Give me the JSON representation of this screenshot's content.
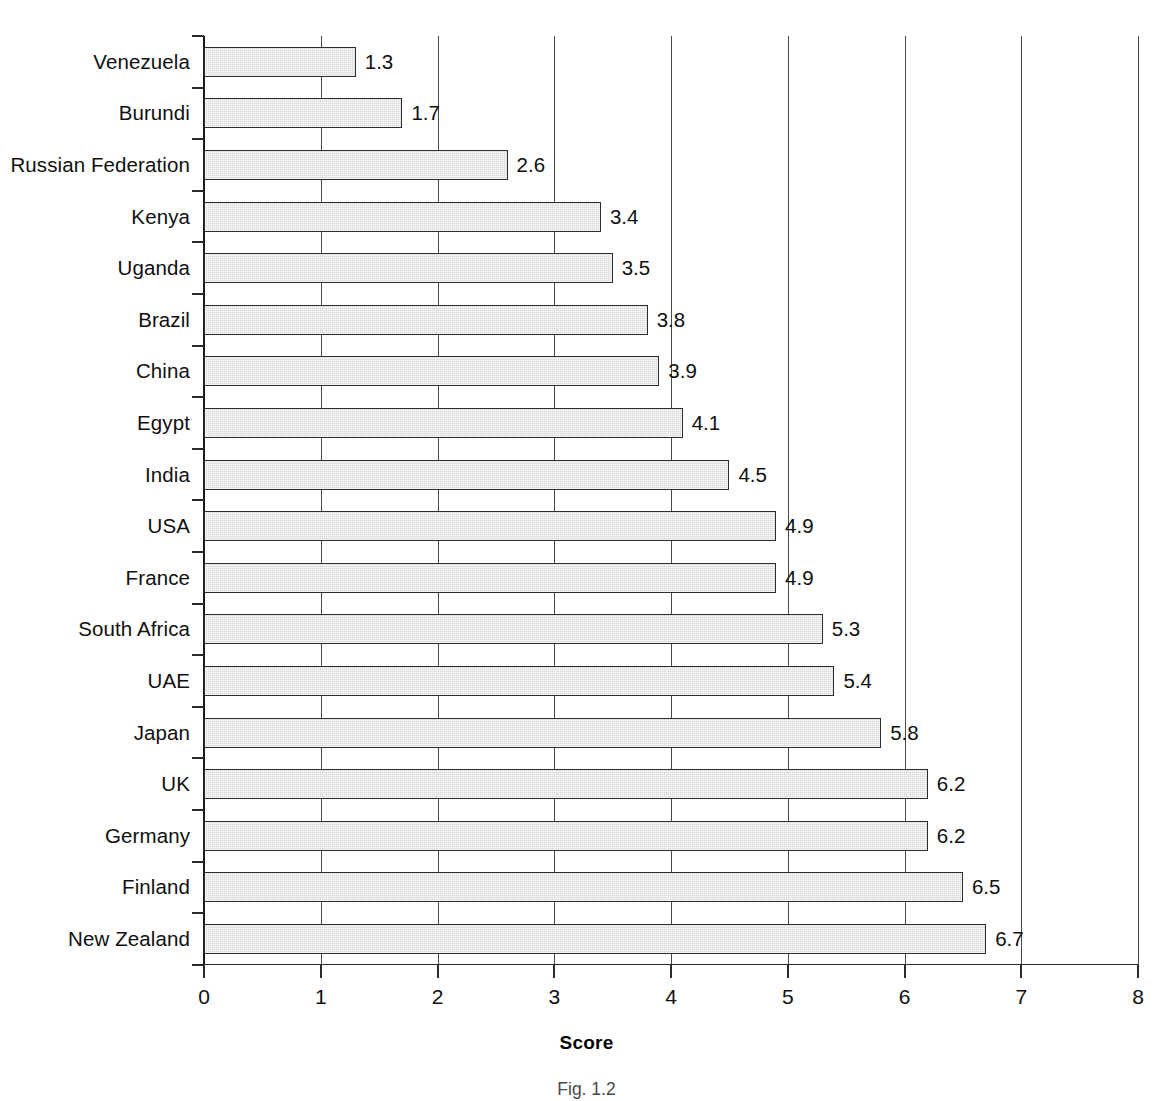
{
  "figure": {
    "axis_title": "Score",
    "caption": "Fig. 1.2",
    "caption_full": "Fig. 1.2",
    "bar_fill_color": "#d9d9d9",
    "bar_border_color": "#2e2e2e",
    "gridline_color": "#4a4a4a",
    "text_color": "#101010"
  },
  "chart_data": {
    "type": "bar",
    "orientation": "horizontal",
    "title": "",
    "xlabel": "Score",
    "ylabel": "",
    "xlim": [
      0,
      8
    ],
    "xticks": [
      "0",
      "1",
      "2",
      "3",
      "4",
      "5",
      "6",
      "7",
      "8"
    ],
    "grid": true,
    "legend": false,
    "categories": [
      "Venezuela",
      "Burundi",
      "Russian Federation",
      "Kenya",
      "Uganda",
      "Brazil",
      "China",
      "Egypt",
      "India",
      "USA",
      "France",
      "South Africa",
      "UAE",
      "Japan",
      "UK",
      "Germany",
      "Finland",
      "New Zealand"
    ],
    "values": [
      1.3,
      1.7,
      2.6,
      3.4,
      3.5,
      3.8,
      3.9,
      4.1,
      4.5,
      4.9,
      4.9,
      5.3,
      5.4,
      5.8,
      6.2,
      6.2,
      6.5,
      6.7
    ],
    "value_labels": [
      "1.3",
      "1.7",
      "2.6",
      "3.4",
      "3.5",
      "3.8",
      "3.9",
      "4.1",
      "4.5",
      "4.9",
      "4.9",
      "5.3",
      "5.4",
      "5.8",
      "6.2",
      "6.2",
      "6.5",
      "6.7"
    ]
  }
}
